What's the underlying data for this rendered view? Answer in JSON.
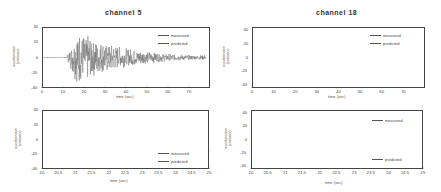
{
  "chart_data": [
    {
      "type": "line",
      "title": "channel 5",
      "xlabel": "time (sec)",
      "ylabel": "acceleration (cm/sec²)",
      "xlim": [
        0,
        80
      ],
      "ylim": [
        -40,
        40
      ],
      "xticks": [
        "0",
        "10",
        "20",
        "30",
        "40",
        "50",
        "60",
        "70"
      ],
      "yticks": [
        "40",
        "20",
        "0",
        "-20",
        "-40"
      ],
      "grid": false,
      "legend_position": "upper right",
      "series": [
        {
          "name": "measured",
          "description": "strong-motion record; quiet until ~12s, peak ±37 near 16–21s, decaying to ~±5 by 75s"
        },
        {
          "name": "predicted",
          "description": "overlaps measured"
        }
      ]
    },
    {
      "type": "line",
      "title": "channel 18",
      "xlabel": "time (sec)",
      "ylabel": "acceleration (cm/sec²)",
      "xlim": [
        0,
        80
      ],
      "ylim": [
        -45,
        45
      ],
      "xticks": [
        "0",
        "10",
        "20",
        "30",
        "40",
        "50",
        "60",
        "70"
      ],
      "yticks": [
        "40",
        "20",
        "0",
        "-20",
        "-40"
      ],
      "grid": false,
      "legend_position": "upper right",
      "series": [
        {
          "name": "measured",
          "description": "quiet until ~10s, peak ±42 near 17–21s, decaying to ~±3 by 75s"
        },
        {
          "name": "predicted",
          "description": "overlaps measured"
        }
      ]
    },
    {
      "type": "line",
      "title": "",
      "xlabel": "time (sec)",
      "ylabel": "acceleration (cm/sec²)",
      "xlim": [
        20,
        25
      ],
      "ylim": [
        -40,
        40
      ],
      "xticks": [
        "20",
        "20.5",
        "21",
        "21.5",
        "22",
        "22.5",
        "23",
        "23.5",
        "24",
        "24.5",
        "25"
      ],
      "yticks": [
        "40",
        "20",
        "0",
        "-20",
        "-40"
      ],
      "grid": false,
      "legend_position": "lower right",
      "series": [
        {
          "name": "measured",
          "x": [
            20.0,
            20.15,
            20.3,
            20.45,
            20.6,
            20.75,
            20.9,
            21.05,
            21.2,
            21.35,
            21.5,
            21.65,
            21.8,
            21.95,
            22.1,
            22.3,
            22.5,
            22.65,
            22.8,
            23.0,
            23.2,
            23.45,
            23.65,
            23.85,
            24.0,
            24.2,
            24.4,
            24.55,
            24.75,
            24.9,
            25.0
          ],
          "y": [
            -20,
            15,
            -5,
            8,
            3,
            -15,
            18,
            -38,
            32,
            -10,
            15,
            -22,
            18,
            -15,
            7,
            -12,
            5,
            8,
            -12,
            3,
            -8,
            15,
            -15,
            2,
            5,
            -8,
            3,
            -5,
            8,
            14,
            -16
          ]
        },
        {
          "name": "predicted",
          "description": "nearly identical to measured"
        }
      ]
    },
    {
      "type": "line",
      "title": "",
      "xlabel": "time (sec)",
      "ylabel": "acceleration (cm/sec²)",
      "xlim": [
        20,
        25
      ],
      "ylim": [
        -45,
        45
      ],
      "xticks": [
        "20",
        "20.5",
        "21",
        "21.5",
        "22",
        "22.5",
        "23",
        "23.5",
        "24",
        "24.5",
        "25"
      ],
      "yticks": [
        "40",
        "20",
        "0",
        "-20",
        "-40"
      ],
      "grid": false,
      "legend_position": "upper right / lower right",
      "series": [
        {
          "name": "measured",
          "x": [
            20.0,
            20.1,
            20.2,
            20.3,
            20.45,
            20.6,
            20.75,
            20.85,
            21.0,
            21.1,
            21.25,
            21.35,
            21.45,
            21.6,
            21.75,
            21.9,
            22.05,
            22.2,
            22.35,
            22.5,
            22.65,
            22.8,
            22.95,
            23.1,
            23.25,
            23.4,
            23.55,
            23.7,
            23.85,
            24.0,
            24.15,
            24.3,
            24.45,
            24.6,
            24.75,
            24.9,
            25.0
          ],
          "y": [
            -8,
            5,
            -10,
            3,
            -15,
            15,
            -18,
            5,
            28,
            -42,
            25,
            -35,
            22,
            -15,
            15,
            -10,
            17,
            -20,
            22,
            -18,
            18,
            -25,
            20,
            -20,
            22,
            -28,
            20,
            -15,
            15,
            -12,
            18,
            -25,
            22,
            -28,
            18,
            -10,
            3
          ]
        },
        {
          "name": "predicted",
          "description": "nearly identical to measured"
        }
      ]
    }
  ],
  "panels": [
    {
      "title": "channel  5",
      "xlabel": "time (sec)",
      "ylabel_1": "acceleration",
      "ylabel_2": "(cm/sec²)",
      "legend": [
        "measured",
        "predicted"
      ],
      "xticks": [
        "0",
        "10",
        "20",
        "30",
        "40",
        "50",
        "60",
        "70"
      ],
      "yticks": [
        "40",
        "20",
        "0",
        "-20",
        "-40"
      ]
    },
    {
      "title": "channel  18",
      "xlabel": "time (sec)",
      "ylabel_1": "acceleration",
      "ylabel_2": "(cm/sec²)",
      "legend": [
        "measured",
        "predicted"
      ],
      "xticks": [
        "0",
        "10",
        "20",
        "30",
        "40",
        "50",
        "60",
        "70"
      ],
      "yticks": [
        "40",
        "20",
        "0",
        "-20",
        "-40"
      ]
    },
    {
      "title": "",
      "xlabel": "time (sec)",
      "ylabel_1": "acceleration",
      "ylabel_2": "(cm/sec²)",
      "legend": [
        "measured",
        "predicted"
      ],
      "xticks": [
        "20",
        "20.5",
        "21",
        "21.5",
        "22",
        "22.5",
        "23",
        "23.5",
        "24",
        "24.5",
        "25"
      ],
      "yticks": [
        "40",
        "20",
        "0",
        "-20",
        "-40"
      ]
    },
    {
      "title": "",
      "xlabel": "time (sec)",
      "ylabel_1": "acceleration",
      "ylabel_2": "(cm/sec²)",
      "legend": [
        "measured",
        "predicted"
      ],
      "xticks": [
        "20",
        "20.5",
        "21",
        "21.5",
        "22",
        "22.5",
        "23",
        "23.5",
        "24",
        "24.5",
        "25"
      ],
      "yticks": [
        "40",
        "20",
        "0",
        "-20",
        "-40"
      ]
    }
  ],
  "colors": {
    "line": "#6a6a6a",
    "frame": "#444444",
    "text": "#333333"
  }
}
